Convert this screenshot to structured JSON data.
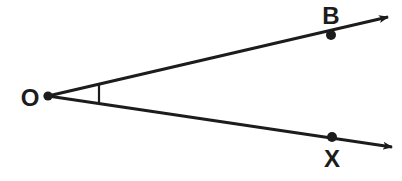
{
  "diagram": {
    "type": "geometry-angle",
    "background_color": "#ffffff",
    "stroke_color": "#1c1c1c",
    "label_color": "#1c1c1c",
    "vertex": {
      "name": "O",
      "label": "O",
      "label_x": 30,
      "label_y": 106,
      "dot_x": 48,
      "dot_y": 96,
      "dot_radius": 4.6
    },
    "rays": [
      {
        "name": "ray-OB",
        "label": "B",
        "label_x": 331,
        "label_y": 24,
        "from_x": 48,
        "from_y": 96,
        "to_x": 388,
        "to_y": 17,
        "point_x": 331,
        "point_y": 35,
        "point_radius": 5.0,
        "arrow": "true"
      },
      {
        "name": "ray-OX",
        "label": "X",
        "label_x": 332,
        "label_y": 167,
        "from_x": 48,
        "from_y": 96,
        "to_x": 392,
        "to_y": 147,
        "point_x": 332,
        "point_y": 137,
        "point_radius": 5.0,
        "arrow": "true"
      }
    ],
    "angle_arc": {
      "name": "angle-arc",
      "description": "angle mark at vertex O",
      "x1": 99,
      "y1": 83,
      "x2": 99,
      "y2": 104
    },
    "line_width": 3.2
  }
}
